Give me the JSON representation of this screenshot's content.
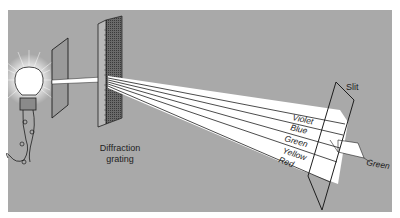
{
  "figure": {
    "background_color": "#a9a9a9",
    "beam_color": "#ffffff",
    "line_color": "#1e1e1e"
  },
  "labels": {
    "grating_line1": "Diffraction",
    "grating_line2": "grating",
    "slit": "Slit",
    "spectrum": [
      "Violet",
      "Blue",
      "Green",
      "Yellow",
      "Red"
    ],
    "transmitted": "Green"
  },
  "components": {
    "light_source": "light-bulb",
    "first_slit": "slit-plate",
    "grating": "diffraction-grating",
    "second_slit": "slit-plate"
  }
}
